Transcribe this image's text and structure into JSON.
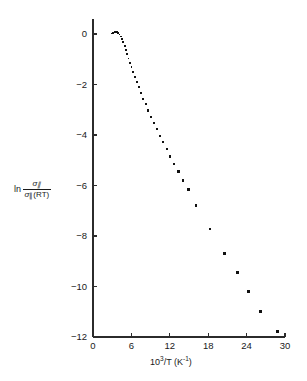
{
  "figure": {
    "background_color": "#ffffff",
    "ink_color": "#111111"
  },
  "chart_data": {
    "type": "scatter",
    "title": "",
    "subtitle": "",
    "xlabel": "10^3/T (K^-1)",
    "ylabel": "ln sigma_parallel / sigma_parallel(RT)",
    "xlabel_parts": {
      "base": "10",
      "exponent": "3",
      "divider": "/T (K",
      "unit_exponent": "-1",
      "close": ")"
    },
    "ylabel_parts": {
      "ln": "ln",
      "numerator_symbol": "σ",
      "numerator_subscript": "∥",
      "denominator_symbol": "σ",
      "denominator_subscript": "∥",
      "denominator_suffix": "(RT)"
    },
    "xlim": [
      0,
      30
    ],
    "ylim": [
      -12,
      0.6
    ],
    "xticks": [
      0,
      6,
      12,
      18,
      24,
      30
    ],
    "xtick_labels": [
      "0",
      "6",
      "12",
      "18",
      "24",
      "30"
    ],
    "yticks": [
      0,
      -2,
      -4,
      -6,
      -8,
      -10,
      -12
    ],
    "ytick_labels": [
      "0",
      "−2",
      "−4",
      "−6",
      "−8",
      "−10",
      "−12"
    ],
    "grid": false,
    "legend": null,
    "marker": "square",
    "series": [
      {
        "name": "conductivity",
        "points": [
          {
            "x": 2.95,
            "y": 0.02,
            "size": 1.8
          },
          {
            "x": 3.15,
            "y": 0.05,
            "size": 1.8
          },
          {
            "x": 3.35,
            "y": 0.07,
            "size": 1.8
          },
          {
            "x": 3.55,
            "y": 0.08,
            "size": 1.8
          },
          {
            "x": 3.75,
            "y": 0.07,
            "size": 1.8
          },
          {
            "x": 3.95,
            "y": 0.04,
            "size": 1.8
          },
          {
            "x": 4.15,
            "y": -0.02,
            "size": 1.8
          },
          {
            "x": 4.35,
            "y": -0.1,
            "size": 1.8
          },
          {
            "x": 4.55,
            "y": -0.2,
            "size": 1.8
          },
          {
            "x": 4.75,
            "y": -0.33,
            "size": 1.9
          },
          {
            "x": 4.95,
            "y": -0.48,
            "size": 1.9
          },
          {
            "x": 5.15,
            "y": -0.64,
            "size": 1.9
          },
          {
            "x": 5.35,
            "y": -0.8,
            "size": 1.9
          },
          {
            "x": 5.55,
            "y": -0.97,
            "size": 1.9
          },
          {
            "x": 5.78,
            "y": -1.14,
            "size": 1.9
          },
          {
            "x": 6.02,
            "y": -1.32,
            "size": 1.9
          },
          {
            "x": 6.28,
            "y": -1.5,
            "size": 1.9
          },
          {
            "x": 6.56,
            "y": -1.7,
            "size": 2.0
          },
          {
            "x": 6.86,
            "y": -1.9,
            "size": 2.0
          },
          {
            "x": 7.18,
            "y": -2.11,
            "size": 2.0
          },
          {
            "x": 7.52,
            "y": -2.33,
            "size": 2.0
          },
          {
            "x": 7.88,
            "y": -2.56,
            "size": 2.0
          },
          {
            "x": 8.26,
            "y": -2.79,
            "size": 2.0
          },
          {
            "x": 8.66,
            "y": -3.03,
            "size": 2.1
          },
          {
            "x": 9.08,
            "y": -3.27,
            "size": 2.1
          },
          {
            "x": 9.52,
            "y": -3.52,
            "size": 2.1
          },
          {
            "x": 9.98,
            "y": -3.77,
            "size": 2.1
          },
          {
            "x": 10.46,
            "y": -4.03,
            "size": 2.2
          },
          {
            "x": 10.96,
            "y": -4.29,
            "size": 2.2
          },
          {
            "x": 11.5,
            "y": -4.56,
            "size": 2.2
          },
          {
            "x": 12.08,
            "y": -4.85,
            "size": 2.3
          },
          {
            "x": 12.7,
            "y": -5.14,
            "size": 2.3
          },
          {
            "x": 13.36,
            "y": -5.45,
            "size": 2.4
          },
          {
            "x": 14.1,
            "y": -5.8,
            "size": 2.5
          },
          {
            "x": 14.92,
            "y": -6.17,
            "size": 2.6
          },
          {
            "x": 16.1,
            "y": -6.8,
            "size": 2.6
          },
          {
            "x": 18.3,
            "y": -7.72,
            "size": 2.7
          },
          {
            "x": 20.6,
            "y": -8.7,
            "size": 2.8
          },
          {
            "x": 22.6,
            "y": -9.45,
            "size": 2.9
          },
          {
            "x": 24.3,
            "y": -10.2,
            "size": 3.0
          },
          {
            "x": 26.2,
            "y": -11.0,
            "size": 3.0
          },
          {
            "x": 28.8,
            "y": -11.8,
            "size": 3.0
          }
        ]
      }
    ]
  }
}
